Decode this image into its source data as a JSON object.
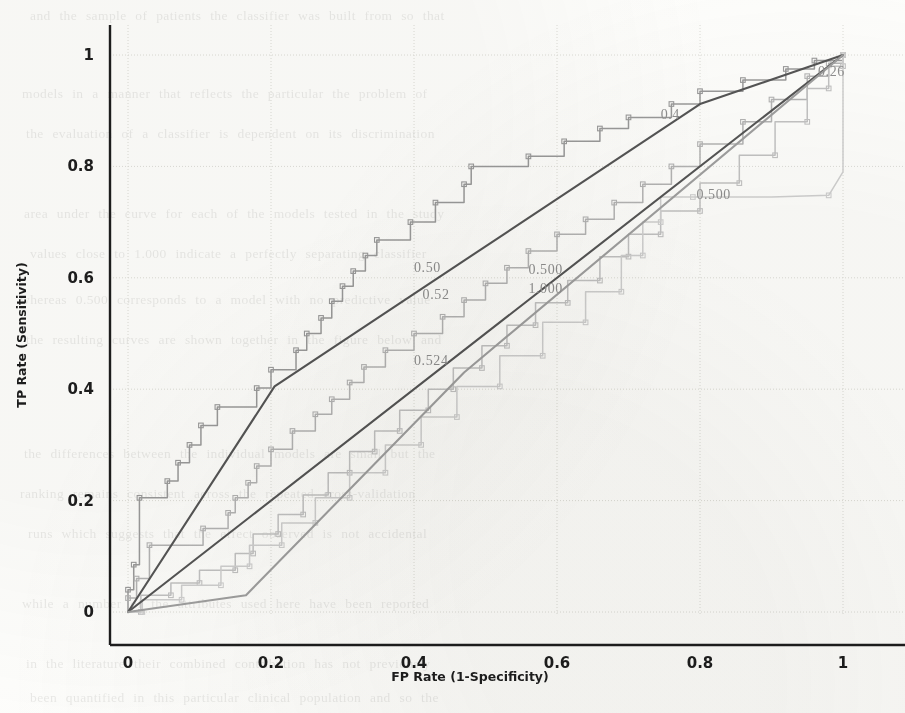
{
  "figure": {
    "kind": "roc-curve-plot",
    "background_color": "#fdfdfb",
    "axis_color": "#1d1d1d",
    "grid_color": "#dcdcd6"
  },
  "chart_data": {
    "type": "line",
    "title": "",
    "xlabel": "FP Rate (1-Specificity)",
    "ylabel": "TP Rate (Sensitivity)",
    "xlim": [
      0,
      1
    ],
    "ylim": [
      0,
      1
    ],
    "xticks": [
      "0",
      "0.2",
      "0.4",
      "0.6",
      "0.8",
      "1"
    ],
    "yticks": [
      "0",
      "0.2",
      "0.4",
      "0.6",
      "0.8",
      "1"
    ],
    "xtick_values": [
      0,
      0.2,
      0.4,
      0.6,
      0.8,
      1
    ],
    "ytick_values": [
      0,
      0.2,
      0.4,
      0.6,
      0.8,
      1
    ],
    "grid": true,
    "legend": "none",
    "annotations": [
      {
        "text": "0.26",
        "x": 0.965,
        "y": 0.962,
        "truncated": true
      },
      {
        "text": "0.4",
        "x": 0.745,
        "y": 0.885,
        "truncated": true
      },
      {
        "text": "0.500",
        "x": 0.795,
        "y": 0.742
      },
      {
        "text": "0.500",
        "x": 0.56,
        "y": 0.607
      },
      {
        "text": "1.000",
        "x": 0.56,
        "y": 0.573
      },
      {
        "text": "0.50",
        "x": 0.4,
        "y": 0.61,
        "truncated": true
      },
      {
        "text": "0.52",
        "x": 0.412,
        "y": 0.562,
        "truncated": true
      },
      {
        "text": "0.524",
        "x": 0.4,
        "y": 0.443
      }
    ],
    "series": [
      {
        "name": "roc-step-upper",
        "style": "step-with-markers",
        "color": "#9a9a9a",
        "points": [
          [
            0.0,
            0.0
          ],
          [
            0.0,
            0.04
          ],
          [
            0.008,
            0.04
          ],
          [
            0.008,
            0.085
          ],
          [
            0.016,
            0.085
          ],
          [
            0.016,
            0.205
          ],
          [
            0.055,
            0.205
          ],
          [
            0.055,
            0.235
          ],
          [
            0.07,
            0.235
          ],
          [
            0.07,
            0.268
          ],
          [
            0.086,
            0.268
          ],
          [
            0.086,
            0.3
          ],
          [
            0.102,
            0.3
          ],
          [
            0.102,
            0.335
          ],
          [
            0.125,
            0.335
          ],
          [
            0.125,
            0.368
          ],
          [
            0.18,
            0.368
          ],
          [
            0.18,
            0.402
          ],
          [
            0.2,
            0.402
          ],
          [
            0.2,
            0.435
          ],
          [
            0.235,
            0.435
          ],
          [
            0.235,
            0.47
          ],
          [
            0.25,
            0.47
          ],
          [
            0.25,
            0.5
          ],
          [
            0.27,
            0.5
          ],
          [
            0.27,
            0.528
          ],
          [
            0.285,
            0.528
          ],
          [
            0.285,
            0.558
          ],
          [
            0.3,
            0.558
          ],
          [
            0.3,
            0.585
          ],
          [
            0.315,
            0.585
          ],
          [
            0.315,
            0.612
          ],
          [
            0.332,
            0.612
          ],
          [
            0.332,
            0.64
          ],
          [
            0.348,
            0.64
          ],
          [
            0.348,
            0.668
          ],
          [
            0.395,
            0.668
          ],
          [
            0.395,
            0.7
          ],
          [
            0.43,
            0.7
          ],
          [
            0.43,
            0.735
          ],
          [
            0.47,
            0.735
          ],
          [
            0.47,
            0.768
          ],
          [
            0.48,
            0.768
          ],
          [
            0.48,
            0.8
          ],
          [
            0.56,
            0.8
          ],
          [
            0.56,
            0.818
          ],
          [
            0.61,
            0.818
          ],
          [
            0.61,
            0.845
          ],
          [
            0.66,
            0.845
          ],
          [
            0.66,
            0.868
          ],
          [
            0.7,
            0.868
          ],
          [
            0.7,
            0.888
          ],
          [
            0.76,
            0.888
          ],
          [
            0.76,
            0.912
          ],
          [
            0.8,
            0.912
          ],
          [
            0.8,
            0.935
          ],
          [
            0.86,
            0.935
          ],
          [
            0.86,
            0.955
          ],
          [
            0.92,
            0.955
          ],
          [
            0.92,
            0.975
          ],
          [
            0.96,
            0.975
          ],
          [
            0.96,
            0.99
          ],
          [
            1.0,
            0.99
          ],
          [
            1.0,
            1.0
          ]
        ]
      },
      {
        "name": "roc-step-second",
        "style": "step-with-markers",
        "color": "#b4b4b4",
        "points": [
          [
            0.0,
            0.0
          ],
          [
            0.0,
            0.025
          ],
          [
            0.012,
            0.025
          ],
          [
            0.012,
            0.06
          ],
          [
            0.03,
            0.06
          ],
          [
            0.03,
            0.12
          ],
          [
            0.105,
            0.12
          ],
          [
            0.105,
            0.15
          ],
          [
            0.14,
            0.15
          ],
          [
            0.14,
            0.178
          ],
          [
            0.15,
            0.178
          ],
          [
            0.15,
            0.205
          ],
          [
            0.168,
            0.205
          ],
          [
            0.168,
            0.232
          ],
          [
            0.18,
            0.232
          ],
          [
            0.18,
            0.262
          ],
          [
            0.2,
            0.262
          ],
          [
            0.2,
            0.292
          ],
          [
            0.23,
            0.292
          ],
          [
            0.23,
            0.325
          ],
          [
            0.262,
            0.325
          ],
          [
            0.262,
            0.355
          ],
          [
            0.285,
            0.355
          ],
          [
            0.285,
            0.382
          ],
          [
            0.31,
            0.382
          ],
          [
            0.31,
            0.412
          ],
          [
            0.33,
            0.412
          ],
          [
            0.33,
            0.44
          ],
          [
            0.36,
            0.44
          ],
          [
            0.36,
            0.47
          ],
          [
            0.4,
            0.47
          ],
          [
            0.4,
            0.5
          ],
          [
            0.44,
            0.5
          ],
          [
            0.44,
            0.53
          ],
          [
            0.47,
            0.53
          ],
          [
            0.47,
            0.56
          ],
          [
            0.5,
            0.56
          ],
          [
            0.5,
            0.59
          ],
          [
            0.53,
            0.59
          ],
          [
            0.53,
            0.618
          ],
          [
            0.56,
            0.618
          ],
          [
            0.56,
            0.648
          ],
          [
            0.6,
            0.648
          ],
          [
            0.6,
            0.678
          ],
          [
            0.64,
            0.678
          ],
          [
            0.64,
            0.705
          ],
          [
            0.68,
            0.705
          ],
          [
            0.68,
            0.735
          ],
          [
            0.72,
            0.735
          ],
          [
            0.72,
            0.768
          ],
          [
            0.76,
            0.768
          ],
          [
            0.76,
            0.8
          ],
          [
            0.8,
            0.8
          ],
          [
            0.8,
            0.84
          ],
          [
            0.86,
            0.84
          ],
          [
            0.86,
            0.88
          ],
          [
            0.9,
            0.88
          ],
          [
            0.9,
            0.92
          ],
          [
            0.95,
            0.92
          ],
          [
            0.95,
            0.962
          ],
          [
            0.98,
            0.962
          ],
          [
            0.98,
            0.985
          ],
          [
            1.0,
            0.985
          ],
          [
            1.0,
            1.0
          ]
        ]
      },
      {
        "name": "roc-step-lower",
        "style": "step-with-markers",
        "color": "#c2c2c2",
        "points": [
          [
            0.0,
            0.0
          ],
          [
            0.018,
            0.0
          ],
          [
            0.018,
            0.03
          ],
          [
            0.06,
            0.03
          ],
          [
            0.06,
            0.052
          ],
          [
            0.1,
            0.052
          ],
          [
            0.1,
            0.075
          ],
          [
            0.15,
            0.075
          ],
          [
            0.15,
            0.105
          ],
          [
            0.175,
            0.105
          ],
          [
            0.175,
            0.14
          ],
          [
            0.21,
            0.14
          ],
          [
            0.21,
            0.175
          ],
          [
            0.245,
            0.175
          ],
          [
            0.245,
            0.21
          ],
          [
            0.28,
            0.21
          ],
          [
            0.28,
            0.25
          ],
          [
            0.31,
            0.25
          ],
          [
            0.31,
            0.288
          ],
          [
            0.345,
            0.288
          ],
          [
            0.345,
            0.325
          ],
          [
            0.38,
            0.325
          ],
          [
            0.38,
            0.362
          ],
          [
            0.42,
            0.362
          ],
          [
            0.42,
            0.4
          ],
          [
            0.455,
            0.4
          ],
          [
            0.455,
            0.438
          ],
          [
            0.495,
            0.438
          ],
          [
            0.495,
            0.478
          ],
          [
            0.53,
            0.478
          ],
          [
            0.53,
            0.515
          ],
          [
            0.57,
            0.515
          ],
          [
            0.57,
            0.555
          ],
          [
            0.615,
            0.555
          ],
          [
            0.615,
            0.595
          ],
          [
            0.66,
            0.595
          ],
          [
            0.66,
            0.638
          ],
          [
            0.7,
            0.638
          ],
          [
            0.7,
            0.678
          ],
          [
            0.745,
            0.678
          ],
          [
            0.745,
            0.72
          ],
          [
            0.8,
            0.72
          ],
          [
            0.8,
            0.77
          ],
          [
            0.855,
            0.77
          ],
          [
            0.855,
            0.82
          ],
          [
            0.905,
            0.82
          ],
          [
            0.905,
            0.88
          ],
          [
            0.95,
            0.88
          ],
          [
            0.95,
            0.94
          ],
          [
            0.98,
            0.94
          ],
          [
            0.98,
            0.98
          ],
          [
            1.0,
            0.98
          ],
          [
            1.0,
            1.0
          ]
        ]
      },
      {
        "name": "roc-flat-tail",
        "style": "step-with-markers",
        "color": "#cfcfcf",
        "points": [
          [
            0.0,
            0.0
          ],
          [
            0.02,
            0.0
          ],
          [
            0.02,
            0.022
          ],
          [
            0.075,
            0.022
          ],
          [
            0.075,
            0.048
          ],
          [
            0.13,
            0.048
          ],
          [
            0.13,
            0.082
          ],
          [
            0.17,
            0.082
          ],
          [
            0.17,
            0.12
          ],
          [
            0.215,
            0.12
          ],
          [
            0.215,
            0.16
          ],
          [
            0.262,
            0.16
          ],
          [
            0.262,
            0.205
          ],
          [
            0.31,
            0.205
          ],
          [
            0.31,
            0.25
          ],
          [
            0.36,
            0.25
          ],
          [
            0.36,
            0.3
          ],
          [
            0.41,
            0.3
          ],
          [
            0.41,
            0.35
          ],
          [
            0.46,
            0.35
          ],
          [
            0.46,
            0.405
          ],
          [
            0.52,
            0.405
          ],
          [
            0.52,
            0.46
          ],
          [
            0.58,
            0.46
          ],
          [
            0.58,
            0.52
          ],
          [
            0.64,
            0.52
          ],
          [
            0.64,
            0.575
          ],
          [
            0.69,
            0.575
          ],
          [
            0.69,
            0.64
          ],
          [
            0.72,
            0.64
          ],
          [
            0.72,
            0.7
          ],
          [
            0.745,
            0.7
          ],
          [
            0.745,
            0.745
          ],
          [
            0.79,
            0.745
          ],
          [
            0.9,
            0.745
          ],
          [
            0.98,
            0.748
          ],
          [
            1.0,
            0.79
          ],
          [
            1.0,
            1.0
          ]
        ]
      },
      {
        "name": "diagonal-upper-dark",
        "style": "straight",
        "color": "#555555",
        "points": [
          [
            0.0,
            0.0
          ],
          [
            0.205,
            0.405
          ],
          [
            0.8,
            0.912
          ],
          [
            1.0,
            1.0
          ]
        ]
      },
      {
        "name": "diagonal-lower-dark",
        "style": "straight",
        "color": "#555555",
        "points": [
          [
            0.0,
            0.0
          ],
          [
            1.0,
            1.0
          ]
        ]
      },
      {
        "name": "diagonal-faint",
        "style": "straight",
        "color": "#9f9f9f",
        "points": [
          [
            0.0,
            0.0
          ],
          [
            0.165,
            0.03
          ],
          [
            0.47,
            0.43
          ],
          [
            1.0,
            1.0
          ]
        ]
      }
    ]
  },
  "background_text": {
    "note": "faint bleed-through of printed page behind the figure",
    "lines": [
      "and the sample of patients the classifier was built from so that",
      "models in a manner that reflects the particular the problem of",
      "the evaluation of a classifier is dependent on its discrimination",
      "area under the curve for each of the models tested in the study",
      "values close to 1.000 indicate a perfectly separating classifier",
      "whereas 0.500 corresponds to a model with no predictive value",
      "the resulting curves are shown together in the figure below and",
      "the differences between the individual models are small but the",
      "ranking remains consistent across the repeated cross-validation",
      "runs which suggests that the effect observed is not accidental",
      "while a number of the attributes used here have been reported",
      "in the literature their combined contribution has not previously",
      "been quantified in this particular clinical population and so the"
    ]
  }
}
